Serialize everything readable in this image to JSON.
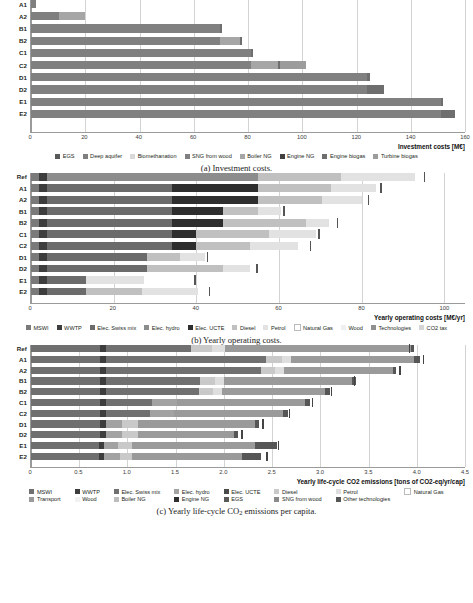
{
  "figure": {
    "panels": [
      {
        "id": "investment-costs",
        "caption": "(a) Investment costs.",
        "caption_prefix": "(a) Investment costs.",
        "axis_title": "Investment costs [M€]",
        "x_ticks": [
          "0",
          "20",
          "40",
          "60",
          "80",
          "100",
          "120",
          "140",
          "160"
        ],
        "row_labels": [
          "A1",
          "A2",
          "B1",
          "B2",
          "C1",
          "C2",
          "D1",
          "D2",
          "E1",
          "E2"
        ],
        "legend": [
          {
            "label": "EGS",
            "color": "#595959"
          },
          {
            "label": "Deep aquifer",
            "color": "#7f7f7f"
          },
          {
            "label": "Biomethanation",
            "color": "#d9d9d9"
          },
          {
            "label": "SNG from wood",
            "color": "#808080"
          },
          {
            "label": "Boiler NG",
            "color": "#a6a6a6"
          },
          {
            "label": "Engine NG",
            "color": "#404040"
          },
          {
            "label": "Engine biogas",
            "color": "#6e6e6e"
          },
          {
            "label": "Turbine biogas",
            "color": "#9c9c9c"
          }
        ]
      },
      {
        "id": "yearly-operating-costs",
        "caption": "(b) Yearly operating costs.",
        "axis_title": "Yearly operating costs [M€/yr]",
        "x_ticks": [
          "0",
          "20",
          "40",
          "60",
          "80",
          "100"
        ],
        "row_labels": [
          "Ref",
          "A1",
          "A2",
          "B1",
          "B2",
          "C1",
          "C2",
          "D1",
          "D2",
          "E1",
          "E2"
        ],
        "legend": [
          {
            "label": "MSWI",
            "color": "#7a7a7a"
          },
          {
            "label": "WWTP",
            "color": "#3d3d3d"
          },
          {
            "label": "Elec. Swiss mix",
            "color": "#6b6b6b"
          },
          {
            "label": "Elec. hydro",
            "color": "#8c8c8c"
          },
          {
            "label": "Elec. UCTE",
            "color": "#2e2e2e"
          },
          {
            "label": "Diesel",
            "color": "#c0c0c0"
          },
          {
            "label": "Petrol",
            "color": "#e2e2e2"
          },
          {
            "label": "Natural Gas",
            "color": "#ffffff"
          },
          {
            "label": "Wood",
            "color": "#efefef"
          },
          {
            "label": "Technologies",
            "color": "#8f8f8f"
          },
          {
            "label": "CO2 tax",
            "color": "#d5d5d5"
          }
        ]
      },
      {
        "id": "yearly-lifecycle-co2-emissions",
        "caption": "(c) Yearly life-cycle CO2 emissions per capita.",
        "axis_title": "Yearly life-cycle CO2 emissions [tons of CO2-eq/yr/cap]",
        "x_ticks": [
          "0",
          "0.5",
          "1.0",
          "1.5",
          "2.0",
          "2.5",
          "3.0",
          "3.5",
          "4.0",
          "4.5"
        ],
        "row_labels": [
          "Ref",
          "A1",
          "A2",
          "B1",
          "B2",
          "C1",
          "C2",
          "D1",
          "D2",
          "E1",
          "E2"
        ],
        "legend_row1": [
          {
            "label": "MSWI",
            "color": "#6f6f6f"
          },
          {
            "label": "WWTP",
            "color": "#3d3d3d"
          },
          {
            "label": "Elec. Swiss mix",
            "color": "#707070"
          },
          {
            "label": "Elec. hydro",
            "color": "#a2a2a2"
          },
          {
            "label": "Elec. UCTE",
            "color": "#4a4a4a"
          },
          {
            "label": "Diesel",
            "color": "#c9c9c9"
          },
          {
            "label": "Petrol",
            "color": "#dedede"
          },
          {
            "label": "Natural Gas",
            "color": "#ffffff"
          }
        ],
        "legend_row2": [
          {
            "label": "Transport",
            "color": "#9a9a9a"
          },
          {
            "label": "Wood",
            "color": "#f2f2f2"
          },
          {
            "label": "Boiler NG",
            "color": "#bdbdbd"
          },
          {
            "label": "Engine NG",
            "color": "#2f2f2f"
          },
          {
            "label": "EGS",
            "color": "#595959"
          },
          {
            "label": "SNG from wood",
            "color": "#8a8a8a"
          },
          {
            "label": "Other technologies",
            "color": "#565656"
          }
        ]
      }
    ]
  },
  "chart_data": [
    {
      "type": "bar",
      "orientation": "horizontal",
      "stacked": true,
      "id": "investment-costs",
      "title": "",
      "xlabel": "Investment costs [M€]",
      "ylabel": "",
      "xlim": [
        0,
        160
      ],
      "xticks": [
        0,
        20,
        40,
        60,
        80,
        100,
        120,
        140,
        160
      ],
      "grid": "vertical",
      "legend_position": "bottom",
      "categories": [
        "A1",
        "A2",
        "B1",
        "B2",
        "C1",
        "C2",
        "D1",
        "D2",
        "E1",
        "E2"
      ],
      "series": [
        {
          "name": "EGS",
          "color": "#595959",
          "values": [
            0,
            0,
            0,
            0,
            0,
            0,
            0,
            0,
            0,
            0
          ]
        },
        {
          "name": "Deep aquifer",
          "color": "#7f7f7f",
          "values": [
            0,
            10.5,
            0,
            0,
            0,
            0,
            0,
            0,
            0,
            0
          ]
        },
        {
          "name": "Biomethanation",
          "color": "#d9d9d9",
          "values": [
            0,
            0,
            0,
            0,
            0,
            0,
            0,
            0,
            0,
            0
          ]
        },
        {
          "name": "SNG from wood",
          "color": "#808080",
          "values": [
            1.8,
            0,
            69.5,
            69.5,
            81.0,
            81.0,
            124.0,
            124.0,
            151.0,
            151.0
          ]
        },
        {
          "name": "Boiler NG",
          "color": "#a6a6a6",
          "values": [
            0,
            9.5,
            0,
            7.5,
            0,
            10.0,
            0,
            0,
            0,
            0
          ]
        },
        {
          "name": "Engine NG",
          "color": "#404040",
          "values": [
            0,
            0,
            0,
            0,
            0,
            0,
            0,
            0,
            0,
            0
          ]
        },
        {
          "name": "Engine biogas",
          "color": "#6e6e6e",
          "values": [
            0,
            0,
            0.8,
            0.8,
            0.8,
            0.8,
            0.8,
            6.0,
            0.8,
            5.5
          ]
        },
        {
          "name": "Turbine biogas",
          "color": "#9c9c9c",
          "values": [
            0,
            0,
            0,
            0,
            0,
            9.5,
            0,
            0,
            0,
            0
          ]
        }
      ],
      "totals": [
        1.8,
        20.0,
        70.3,
        77.8,
        81.8,
        101.3,
        124.8,
        130.0,
        151.8,
        156.5
      ]
    },
    {
      "type": "bar",
      "orientation": "horizontal",
      "stacked": true,
      "id": "yearly-operating-costs",
      "title": "",
      "xlabel": "Yearly operating costs [M€/yr]",
      "ylabel": "",
      "xlim": [
        0,
        105
      ],
      "xticks": [
        0,
        20,
        40,
        60,
        80,
        100
      ],
      "grid": "vertical",
      "legend_position": "bottom",
      "categories": [
        "Ref",
        "A1",
        "A2",
        "B1",
        "B2",
        "C1",
        "C2",
        "D1",
        "D2",
        "E1",
        "E2"
      ],
      "series": [
        {
          "name": "MSWI",
          "color": "#7a7a7a",
          "values": [
            2.0,
            2.0,
            2.0,
            2.0,
            2.0,
            2.0,
            2.0,
            2.0,
            2.0,
            2.0,
            2.0
          ]
        },
        {
          "name": "WWTP",
          "color": "#3d3d3d",
          "values": [
            1.8,
            1.8,
            1.8,
            1.8,
            1.8,
            1.8,
            1.8,
            1.8,
            1.8,
            1.8,
            1.8
          ]
        },
        {
          "name": "Elec. Swiss mix",
          "color": "#6b6b6b",
          "values": [
            0,
            30.2,
            30.2,
            30.2,
            30.2,
            30.2,
            30.2,
            24.2,
            24.2,
            9.5,
            9.5
          ]
        },
        {
          "name": "Elec. hydro",
          "color": "#8c8c8c",
          "values": [
            51.2,
            0,
            0,
            0,
            0,
            0,
            0,
            0,
            0,
            0,
            0
          ]
        },
        {
          "name": "Elec. UCTE",
          "color": "#2e2e2e",
          "values": [
            0,
            21.0,
            21.0,
            12.5,
            12.5,
            6.0,
            6.0,
            0,
            0,
            0,
            0
          ]
        },
        {
          "name": "Diesel",
          "color": "#c0c0c0",
          "values": [
            20.0,
            17.5,
            15.5,
            8.5,
            20.0,
            17.5,
            13.0,
            8.0,
            18.5,
            0,
            13.5
          ]
        },
        {
          "name": "Petrol",
          "color": "#e2e2e2",
          "values": [
            18.0,
            11.0,
            9.5,
            5.5,
            5.5,
            11.5,
            11.5,
            6.0,
            6.5,
            14.0,
            13.5
          ]
        },
        {
          "name": "Natural Gas",
          "color": "#ffffff",
          "values": [
            0,
            0,
            0,
            0,
            0,
            0,
            0,
            0,
            0,
            0,
            0
          ]
        },
        {
          "name": "Wood",
          "color": "#efefef",
          "values": [
            0,
            0,
            0,
            0,
            0,
            0,
            0,
            0,
            0,
            0,
            0
          ]
        },
        {
          "name": "Technologies",
          "color": "#8f8f8f",
          "values": [
            0,
            0,
            0,
            0,
            0,
            0,
            0,
            0,
            0,
            0,
            0
          ]
        },
        {
          "name": "CO2 tax",
          "color": "#d5d5d5",
          "values": [
            0,
            0,
            0,
            0,
            0,
            0,
            0,
            0,
            0,
            0,
            0
          ]
        }
      ],
      "totals": [
        93.0,
        83.5,
        80.0,
        60.5,
        72.0,
        69.0,
        64.5,
        42.0,
        53.0,
        27.3,
        40.3
      ],
      "marker_values": [
        95.0,
        84.5,
        81.5,
        61.0,
        74.0,
        69.5,
        67.5,
        42.5,
        54.5,
        39.5,
        43.0
      ]
    },
    {
      "type": "bar",
      "orientation": "horizontal",
      "stacked": true,
      "id": "yearly-lifecycle-co2-emissions",
      "title": "",
      "xlabel": "Yearly life-cycle CO2 emissions [tons of CO2-eq/yr/cap]",
      "ylabel": "",
      "xlim": [
        0,
        4.5
      ],
      "xticks": [
        0,
        0.5,
        1.0,
        1.5,
        2.0,
        2.5,
        3.0,
        3.5,
        4.0,
        4.5
      ],
      "grid": "vertical",
      "legend_position": "bottom",
      "categories": [
        "Ref",
        "A1",
        "A2",
        "B1",
        "B2",
        "C1",
        "C2",
        "D1",
        "D2",
        "E1",
        "E2"
      ],
      "series": [
        {
          "name": "MSWI",
          "color": "#6f6f6f",
          "values": [
            0.72,
            0.72,
            0.72,
            0.72,
            0.72,
            0.72,
            0.72,
            0.72,
            0.72,
            0.7,
            0.7
          ]
        },
        {
          "name": "WWTP",
          "color": "#3d3d3d",
          "values": [
            0.06,
            0.06,
            0.06,
            0.06,
            0.06,
            0.06,
            0.06,
            0.06,
            0.06,
            0.06,
            0.06
          ]
        },
        {
          "name": "Elec. Swiss mix",
          "color": "#707070",
          "values": [
            0.88,
            1.66,
            1.61,
            0.97,
            0.96,
            0.47,
            0.45,
            0.0,
            0.0,
            0.0,
            0.0
          ]
        },
        {
          "name": "Elec. hydro",
          "color": "#a2a2a2",
          "values": [
            0.0,
            0.0,
            0.0,
            0.0,
            0.0,
            0.26,
            0.25,
            0.16,
            0.16,
            0.14,
            0.16
          ]
        },
        {
          "name": "Elec. UCTE",
          "color": "#4a4a4a",
          "values": [
            0.0,
            0.0,
            0.0,
            0.0,
            0.0,
            0.0,
            0.0,
            0.0,
            0.0,
            0.0,
            0.0
          ]
        },
        {
          "name": "Diesel",
          "color": "#c9c9c9",
          "values": [
            0.22,
            0.16,
            0.14,
            0.16,
            0.15,
            0.0,
            0.0,
            0.17,
            0.17,
            0.15,
            0.13
          ]
        },
        {
          "name": "Petrol",
          "color": "#dedede",
          "values": [
            0.13,
            0.1,
            0.09,
            0.09,
            0.09,
            0.0,
            0.0,
            0.0,
            0.0,
            0.0,
            0.0
          ]
        },
        {
          "name": "Transport",
          "color": "#9a9a9a",
          "values": [
            1.93,
            1.27,
            1.13,
            1.33,
            1.07,
            1.33,
            1.13,
            1.21,
            1.0,
            1.27,
            1.14
          ]
        },
        {
          "name": "Other technologies",
          "color": "#565656",
          "values": [
            0.03,
            0.06,
            0.04,
            0.04,
            0.05,
            0.05,
            0.05,
            0.04,
            0.04,
            0.23,
            0.2
          ]
        }
      ],
      "totals": [
        3.97,
        4.03,
        3.79,
        3.37,
        3.1,
        2.89,
        2.66,
        2.36,
        2.15,
        2.55,
        2.39
      ],
      "marker_values": [
        3.92,
        4.06,
        3.82,
        3.35,
        3.11,
        2.91,
        2.67,
        2.4,
        2.18,
        2.56,
        2.44
      ]
    }
  ]
}
